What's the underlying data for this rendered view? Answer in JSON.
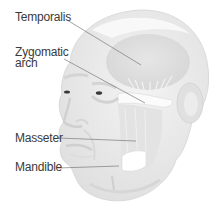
{
  "diagram": {
    "labels": [
      {
        "id": "temporalis",
        "text": "Temporalis"
      },
      {
        "id": "zygomatic-arch",
        "line1": "Zygomatic",
        "line2": "arch"
      },
      {
        "id": "masseter",
        "text": "Masseter"
      },
      {
        "id": "mandible",
        "text": "Mandible"
      }
    ],
    "colors": {
      "background": "#ffffff",
      "skin": "#ececec",
      "skin_shadow": "#dcdcdc",
      "muscle": "#e2e2e2",
      "highlight": "#fafafa",
      "label_text": "#3a3a3a",
      "leader_line": "#7a7a7a"
    }
  }
}
